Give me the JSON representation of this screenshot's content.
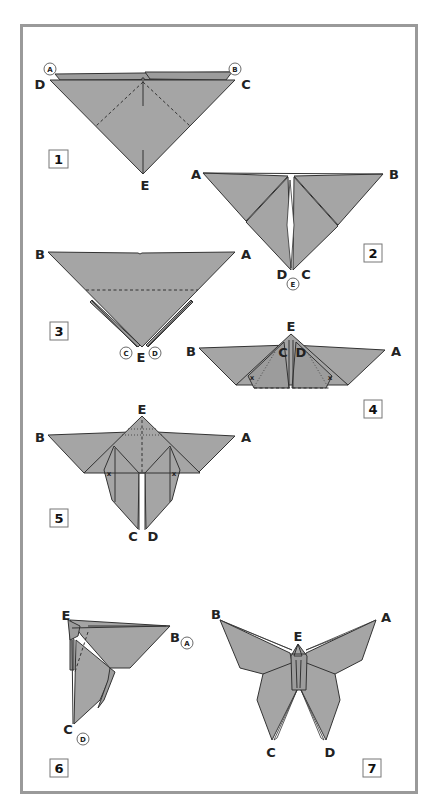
{
  "diagram": {
    "colors": {
      "paper_fill": "#a5a5a5",
      "frame_border": "#9a9a9a",
      "line": "#333333",
      "background": "#ffffff"
    },
    "steps": [
      {
        "number": "1",
        "labels": {
          "D": "D",
          "C": "C",
          "E": "E"
        },
        "circled": {
          "A": "A",
          "B": "B"
        }
      },
      {
        "number": "2",
        "labels": {
          "A": "A",
          "B": "B",
          "D": "D",
          "C": "C"
        },
        "circled": {
          "E": "E"
        }
      },
      {
        "number": "3",
        "labels": {
          "B": "B",
          "A": "A",
          "E": "E"
        },
        "circled": {
          "C": "C",
          "D": "D"
        }
      },
      {
        "number": "4",
        "labels": {
          "B": "B",
          "A": "A",
          "E": "E",
          "C": "C",
          "D": "D"
        },
        "marks": [
          "x",
          "x"
        ]
      },
      {
        "number": "5",
        "labels": {
          "B": "B",
          "A": "A",
          "E": "E",
          "C": "C",
          "D": "D"
        },
        "marks": [
          "x",
          "x"
        ]
      },
      {
        "number": "6",
        "labels": {
          "E": "E",
          "B": "B",
          "C": "C"
        },
        "circled": {
          "A": "A",
          "D": "D"
        }
      },
      {
        "number": "7",
        "labels": {
          "B": "B",
          "A": "A",
          "E": "E",
          "C": "C",
          "D": "D"
        }
      }
    ]
  }
}
